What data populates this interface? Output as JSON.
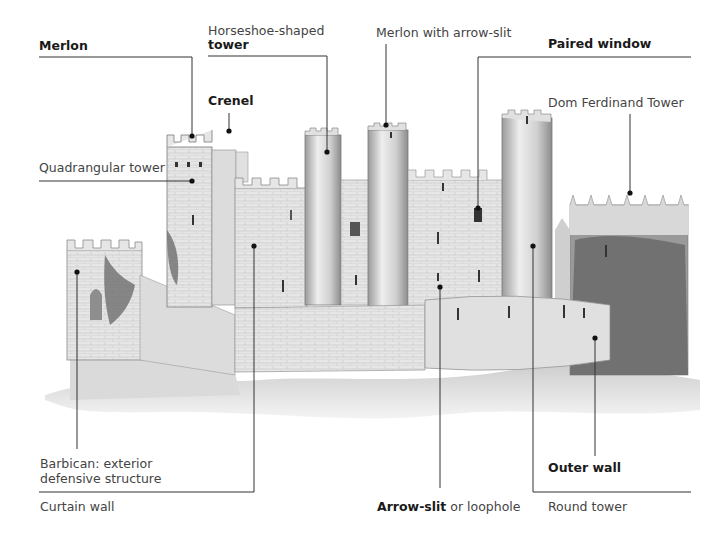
{
  "diagram": {
    "labels": {
      "merlon": "Merlon",
      "horseshoe_line1": "Horseshoe-shaped",
      "horseshoe_line2": "tower",
      "merlon_arrow_slit": "Merlon with arrow-slit",
      "paired_window": "Paired window",
      "crenel": "Crenel",
      "dom_ferdinand": "Dom Ferdinand Tower",
      "quadrangular_tower": "Quadrangular tower",
      "barbican_line1": "Barbican: exterior",
      "barbican_line2": "defensive structure",
      "curtain_wall": "Curtain wall",
      "arrow_slit_bold": "Arrow-slit",
      "arrow_slit_rest": " or loophole",
      "outer_wall": "Outer wall",
      "round_tower": "Round tower"
    },
    "colors": {
      "line": "#333333",
      "stone_light": "#e4e4e4",
      "stone_mid": "#c8c8c8",
      "stone_dark": "#8a8a8a",
      "foliage": "#6e6e6e"
    }
  }
}
